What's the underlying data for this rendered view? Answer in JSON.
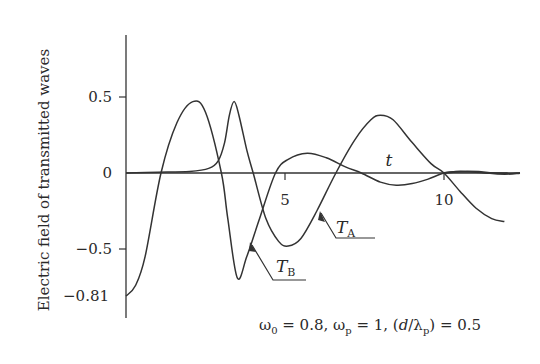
{
  "chart_data": {
    "type": "line",
    "title": "",
    "xlabel": "t",
    "ylabel": "Electric field of transmitted waves",
    "xlim": [
      0,
      12.4
    ],
    "ylim": [
      -0.95,
      0.9
    ],
    "x_ticks": [
      5,
      10
    ],
    "x_tick_labels": [
      "5",
      "10"
    ],
    "y_ticks": [
      0.5,
      0,
      -0.5,
      -0.81
    ],
    "y_tick_labels": [
      "0.5",
      "0",
      "-0.5",
      "-0.81"
    ],
    "grid": false,
    "legend": "inline arrow labels",
    "caption": "ω0 = 0.8, ωp = 1, (d/λp) = 0.5",
    "series": [
      {
        "name": "T_A",
        "label_main": "T",
        "label_sub": "A",
        "x": [
          0,
          1,
          2,
          2.6,
          2.9,
          3.1,
          3.25,
          3.4,
          3.55,
          3.8,
          4.0,
          4.4,
          4.8,
          5.1,
          5.5,
          6.0,
          6.6,
          7.2,
          7.7,
          8.0,
          8.4,
          9.0,
          9.6,
          10.0,
          10.5,
          11.0,
          11.5,
          11.9
        ],
        "y": [
          0.0,
          0.005,
          0.01,
          0.03,
          0.08,
          0.2,
          0.38,
          0.47,
          0.38,
          0.15,
          0.0,
          -0.3,
          -0.45,
          -0.48,
          -0.43,
          -0.25,
          0.0,
          0.22,
          0.35,
          0.38,
          0.35,
          0.2,
          0.06,
          0.0,
          -0.12,
          -0.23,
          -0.3,
          -0.32
        ]
      },
      {
        "name": "T_B",
        "label_main": "T",
        "label_sub": "B",
        "x": [
          0,
          0.3,
          0.6,
          1.1,
          1.6,
          2.1,
          2.5,
          3.0,
          3.2,
          3.5,
          3.8,
          4.2,
          4.7,
          5.1,
          5.7,
          6.3,
          6.9,
          7.4,
          8.0,
          8.5,
          9.0,
          9.5,
          10.0,
          10.5,
          11.0,
          11.5,
          12.0
        ],
        "y": [
          -0.81,
          -0.74,
          -0.55,
          0.0,
          0.33,
          0.47,
          0.4,
          0.0,
          -0.3,
          -0.69,
          -0.55,
          -0.3,
          0.0,
          0.09,
          0.13,
          0.1,
          0.04,
          0.0,
          -0.06,
          -0.08,
          -0.07,
          -0.04,
          0.0,
          0.01,
          0.005,
          0.0,
          0.0
        ]
      }
    ]
  },
  "labels": {
    "y_axis_title": "Electric field of transmitted waves",
    "x_axis_var": "t",
    "tick_y_05": "0.5",
    "tick_y_0": "0",
    "tick_y_m05": "−0.5",
    "tick_y_m081": "−0.81",
    "tick_x_5": "5",
    "tick_x_10": "10",
    "ta_main": "T",
    "ta_sub": "A",
    "tb_main": "T",
    "tb_sub": "B"
  },
  "caption": {
    "omega0_sym": "ω",
    "omega0_sub": "0",
    "omega0_val": " = 0.8, ",
    "omegap_sym": "ω",
    "omegap_sub": "p",
    "omegap_val": " = 1, (",
    "d": "d",
    "slash_lambda": "/λ",
    "lambda_sub": "p",
    "ratio_val": ") = 0.5"
  }
}
